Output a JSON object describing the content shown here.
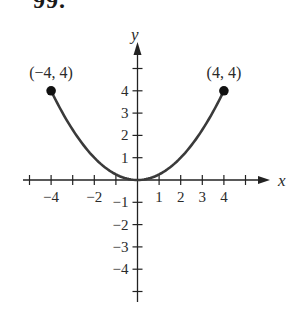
{
  "problem_number": "99.",
  "chart_data": {
    "type": "line",
    "title": "",
    "function": "y = x^2 / 4",
    "domain": [
      -4,
      4
    ],
    "x": [
      -4,
      -3,
      -2,
      -1,
      0,
      1,
      2,
      3,
      4
    ],
    "series": [
      {
        "name": "parabola",
        "values": [
          4,
          2.25,
          1,
          0.25,
          0,
          0.25,
          1,
          2.25,
          4
        ],
        "color": "#3a3a3a"
      }
    ],
    "endpoints": [
      {
        "x": -4,
        "y": 4,
        "label": "(−4, 4)",
        "closed": true
      },
      {
        "x": 4,
        "y": 4,
        "label": "(4, 4)",
        "closed": true
      }
    ],
    "xlabel": "x",
    "ylabel": "y",
    "x_tick_labels": [
      "−4",
      "−2",
      "1",
      "2",
      "3",
      "4"
    ],
    "y_tick_labels": [
      "4",
      "3",
      "2",
      "1",
      "−1",
      "−2",
      "−3",
      "−4"
    ],
    "xlim": [
      -5,
      6
    ],
    "ylim": [
      -5.5,
      6
    ],
    "grid": false,
    "legend": "none"
  }
}
